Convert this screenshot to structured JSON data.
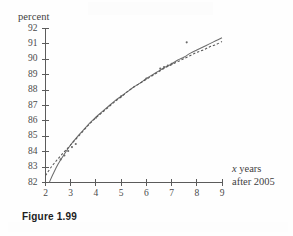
{
  "figure": {
    "caption": "Figure 1.99"
  },
  "chart_data": {
    "type": "line",
    "title": "",
    "xlabel_line1": "x years",
    "xlabel_line2": "after 2005",
    "xlabel_italic_part": "x",
    "ylabel": "percent",
    "xlim": [
      2,
      9
    ],
    "ylim": [
      82,
      92
    ],
    "xticks": [
      2,
      3,
      4,
      5,
      6,
      7,
      8,
      9
    ],
    "yticks": [
      82,
      83,
      84,
      85,
      86,
      87,
      88,
      89,
      90,
      91,
      92
    ],
    "xtick_labels": [
      "2",
      "3",
      "4",
      "5",
      "6",
      "7",
      "8",
      "9"
    ],
    "ytick_labels": [
      "82",
      "83",
      "84",
      "85",
      "86",
      "87",
      "88",
      "89",
      "90",
      "91",
      "92"
    ],
    "grid": false,
    "legend": "none",
    "axis_color": "#5b5b5b",
    "series": [
      {
        "name": "model-curve-solid",
        "style": "solid",
        "color": "#6d6d6d",
        "x": [
          2.15,
          2.3,
          2.5,
          2.75,
          3.0,
          3.25,
          3.5,
          3.75,
          4.0,
          4.25,
          4.5,
          4.75,
          5.0,
          5.25,
          5.5,
          5.75,
          6.0,
          6.25,
          6.5,
          6.75,
          7.0,
          7.25,
          7.5,
          7.75,
          8.0,
          8.25,
          8.5,
          8.75,
          9.0
        ],
        "y": [
          82.0,
          82.55,
          83.2,
          83.85,
          84.45,
          84.95,
          85.4,
          85.85,
          86.25,
          86.6,
          86.95,
          87.3,
          87.6,
          87.9,
          88.2,
          88.45,
          88.75,
          89.0,
          89.25,
          89.5,
          89.7,
          89.95,
          90.15,
          90.4,
          90.6,
          90.8,
          91.0,
          91.2,
          91.4
        ]
      },
      {
        "name": "model-curve-dashed",
        "style": "dashed",
        "color": "#575757",
        "x": [
          2.0,
          2.25,
          2.5,
          2.75,
          3.0,
          3.25,
          3.5,
          3.75,
          4.0,
          4.25,
          4.5,
          4.75,
          5.0,
          5.25,
          5.5,
          5.75,
          6.0,
          6.25,
          6.5,
          6.75,
          7.0,
          7.25,
          7.5,
          7.75,
          8.0,
          8.25,
          8.5,
          8.75,
          9.0
        ],
        "y": [
          82.45,
          83.05,
          83.55,
          84.0,
          84.45,
          84.9,
          85.35,
          85.8,
          86.2,
          86.55,
          86.9,
          87.25,
          87.55,
          87.9,
          88.2,
          88.45,
          88.7,
          88.95,
          89.2,
          89.45,
          89.65,
          89.85,
          90.05,
          90.25,
          90.45,
          90.6,
          90.8,
          90.95,
          91.15
        ]
      }
    ],
    "scatter": {
      "name": "observed-data-points",
      "color": "#6a6a6a",
      "x": [
        2.6,
        2.75,
        2.9,
        3.05,
        3.2,
        4.0,
        5.0,
        6.0,
        6.55,
        6.7,
        6.85,
        7.0,
        7.6
      ],
      "y": [
        83.5,
        83.75,
        84.05,
        84.3,
        84.5,
        86.2,
        87.6,
        88.75,
        89.4,
        89.5,
        89.6,
        89.7,
        91.1
      ]
    }
  }
}
